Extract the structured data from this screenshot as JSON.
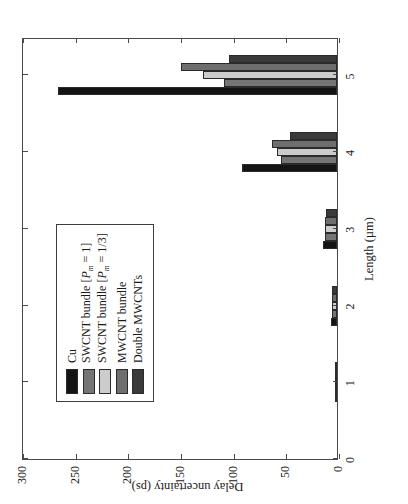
{
  "chart_data": {
    "type": "bar",
    "title": "",
    "orientation": "vertical-columns-rotated-page",
    "xlabel": "Length (µm)",
    "ylabel": "Delay uncertainty (ps)",
    "xlim": [
      0,
      5.5
    ],
    "ylim": [
      0,
      300
    ],
    "xticks": [
      0,
      1,
      2,
      3,
      4,
      5
    ],
    "xticklabels": [
      "0",
      "1",
      "2",
      "3",
      "4",
      "5"
    ],
    "yticks": [
      0,
      50,
      100,
      150,
      200,
      250,
      300
    ],
    "yticklabels": [
      "0",
      "50",
      "100",
      "150",
      "200",
      "250",
      "300"
    ],
    "grid": false,
    "legend_position": "upper left",
    "categories": [
      "1",
      "2",
      "3",
      "4",
      "5"
    ],
    "series": [
      {
        "name": "Cu",
        "color": "#141414",
        "values": [
          1,
          6,
          13,
          90,
          265
        ]
      },
      {
        "name": "SWCNT bundle [Pm = 1]",
        "color": "#757575",
        "values": [
          1,
          5,
          11,
          53,
          107
        ]
      },
      {
        "name": "SWCNT bundle [Pm = 1/3]",
        "color": "#cccccc",
        "values": [
          1,
          5,
          11,
          57,
          127
        ]
      },
      {
        "name": "MWCNT bundle",
        "color": "#6e6e6e",
        "values": [
          1,
          5,
          11,
          62,
          148
        ]
      },
      {
        "name": "Double MWCNTs",
        "color": "#3a3a3a",
        "values": [
          1,
          5,
          10,
          45,
          103
        ]
      }
    ]
  },
  "legend": {
    "items": [
      {
        "label": "Cu",
        "label_prefix": "Cu",
        "sub": "",
        "suffix": "",
        "color": "#141414"
      },
      {
        "label": "SWCNT bundle [Pm = 1]",
        "label_prefix": "SWCNT bundle [",
        "sub": "m",
        "suffix": " = 1]",
        "color": "#757575"
      },
      {
        "label": "SWCNT bundle [Pm = 1/3]",
        "label_prefix": "SWCNT bundle [",
        "sub": "m",
        "suffix": " = 1/3]",
        "color": "#cccccc"
      },
      {
        "label": "MWCNT bundle",
        "label_prefix": "MWCNT bundle",
        "sub": "",
        "suffix": "",
        "color": "#6e6e6e"
      },
      {
        "label": "Double MWCNTs",
        "label_prefix": "Double MWCNTs",
        "sub": "",
        "suffix": "",
        "color": "#3a3a3a"
      }
    ],
    "italic_symbol": "P"
  },
  "axes": {
    "x_title": "Length (µm)",
    "y_title": "Delay uncertainty (ps)"
  }
}
